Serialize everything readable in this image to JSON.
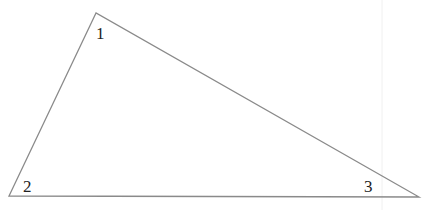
{
  "diagram": {
    "type": "triangle",
    "stroke_color": "#8a8a8a",
    "label_color": "#222222",
    "vertices": {
      "top": [
        96,
        13
      ],
      "bottom_left": [
        9,
        196
      ],
      "bottom_right": [
        419,
        197
      ]
    },
    "angle_labels": [
      {
        "id": "1",
        "text": "1",
        "x": 96,
        "y": 39
      },
      {
        "id": "2",
        "text": "2",
        "x": 23,
        "y": 192
      },
      {
        "id": "3",
        "text": "3",
        "x": 364,
        "y": 192
      }
    ]
  }
}
